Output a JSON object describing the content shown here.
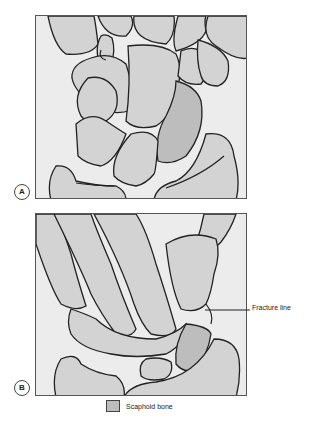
{
  "figure": {
    "panels": [
      {
        "id": "A",
        "label": "A"
      },
      {
        "id": "B",
        "label": "B"
      }
    ],
    "callouts": [
      {
        "panel": "B",
        "text": "Fracture line"
      }
    ],
    "legend": {
      "label": "Scaphoid bone",
      "color": "#bdbdbd"
    },
    "colors": {
      "background": "#ececec",
      "bone": "#d3d3d3",
      "scaphoid": "#bdbdbd",
      "outline": "#222222"
    }
  }
}
